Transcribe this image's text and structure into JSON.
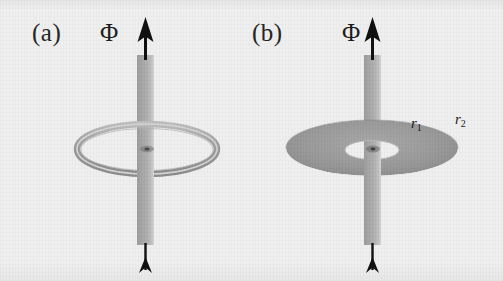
{
  "figure": {
    "background_color": "#efefef",
    "width": 503,
    "height": 281,
    "tube_color": "#a9a9a9",
    "ring_color": "#9a9a9a",
    "arrow_color": "#111111",
    "label_color": "#262626"
  },
  "panels": [
    {
      "id": "a",
      "label": "(a)",
      "flux_label": "Φ",
      "geometry_type": "thin torus ring",
      "ring": {
        "center_x": 145,
        "center_y": 148,
        "outer_rx": 67,
        "outer_ry": 22,
        "tube_thickness": 6,
        "filled": false
      },
      "radius_labels": []
    },
    {
      "id": "b",
      "label": "(b)",
      "flux_label": "Φ",
      "geometry_type": "filled annulus",
      "annulus": {
        "center_x": 372,
        "center_y": 148,
        "outer_rx": 85,
        "outer_ry": 28,
        "inner_rx": 26,
        "inner_ry": 9,
        "filled": true
      },
      "radius_labels": [
        {
          "text": "r",
          "subscript": "1",
          "x": 411,
          "y": 124
        },
        {
          "text": "r",
          "subscript": "2",
          "x": 455,
          "y": 120
        }
      ]
    }
  ],
  "annotations": {
    "arrow_direction": "up",
    "arrow_top_label": "flux arrowhead",
    "arrow_bottom_label": "flux arrow tail"
  }
}
